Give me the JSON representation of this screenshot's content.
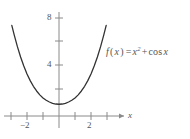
{
  "chart_data": {
    "type": "line",
    "title": "",
    "subtitle": "",
    "xlabel": "x",
    "ylabel": "",
    "function": "f(x) = x^2 + cos x",
    "grid": false,
    "legend_position": "inline-right",
    "xlim": [
      -3.2,
      3.2
    ],
    "ylim": [
      -0.6,
      9.2
    ],
    "x_ticks": [
      -3,
      -2,
      -1,
      0,
      1,
      2,
      3
    ],
    "x_tick_labels": [
      "",
      "−2",
      "",
      "",
      "",
      "2",
      ""
    ],
    "y_ticks": [
      2,
      4,
      6,
      8
    ],
    "y_tick_labels": [
      "",
      "4",
      "",
      "8"
    ],
    "x": [
      -2.95,
      -2.8,
      -2.6,
      -2.4,
      -2.2,
      -2.0,
      -1.8,
      -1.6,
      -1.4,
      -1.2,
      -1.0,
      -0.8,
      -0.6,
      -0.4,
      -0.2,
      0.0,
      0.2,
      0.4,
      0.6,
      0.8,
      1.0,
      1.2,
      1.4,
      1.6,
      1.8,
      2.0,
      2.2,
      2.4,
      2.6,
      2.8,
      2.95
    ],
    "y": [
      7.72,
      6.9,
      5.9,
      5.02,
      4.25,
      3.58,
      3.01,
      2.53,
      2.13,
      1.8,
      1.54,
      1.34,
      1.19,
      1.08,
      1.02,
      1.0,
      1.02,
      1.08,
      1.19,
      1.34,
      1.54,
      1.8,
      2.13,
      2.53,
      3.01,
      3.58,
      4.25,
      5.02,
      5.9,
      6.9,
      7.72
    ],
    "vertex": {
      "x": 0,
      "y": 1
    },
    "curve_color": "#333333",
    "axis_color": "#8a8a8a",
    "text_color": "#555555",
    "background": "#ffffff"
  },
  "labels": {
    "y_8": "8",
    "y_4": "4",
    "x_neg2": "−2",
    "x_2": "2",
    "x_axis_name": "x"
  },
  "annotation": {
    "formula_plain": "f(x) = x² + cos x",
    "f": "f",
    "open_paren": "(",
    "var": "x",
    "close_paren": ")",
    "equals": "=",
    "x_base": "x",
    "exponent": "2",
    "plus": "+",
    "cos": "cos",
    "cos_arg": "x"
  }
}
